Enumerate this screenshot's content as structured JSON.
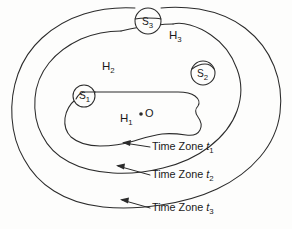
{
  "figure": {
    "name": "nested-time-zone-contours",
    "background_color": "#fdfdfc",
    "ink_color": "#2b2b2b",
    "width": 292,
    "height": 229
  },
  "regions": [
    {
      "id": "H1",
      "base": "H",
      "sub": "1",
      "x": 120,
      "y": 122,
      "description": "innermost region"
    },
    {
      "id": "H2",
      "base": "H",
      "sub": "2",
      "x": 102,
      "y": 70,
      "description": "middle region"
    },
    {
      "id": "H3",
      "base": "H",
      "sub": "3",
      "x": 169,
      "y": 39,
      "description": "outer region"
    }
  ],
  "spheres": [
    {
      "id": "S1",
      "base": "S",
      "sub": "1",
      "cx": 84,
      "cy": 96,
      "r": 11,
      "label_x": 79,
      "label_y": 99
    },
    {
      "id": "S2",
      "base": "S",
      "sub": "2",
      "cx": 203,
      "cy": 73,
      "r": 12,
      "label_x": 197,
      "label_y": 77
    },
    {
      "id": "S3",
      "base": "S",
      "sub": "3",
      "cx": 148,
      "cy": 21,
      "r": 13,
      "label_x": 142,
      "label_y": 25
    }
  ],
  "center_point": {
    "id": "O",
    "label": "O",
    "dot_x": 141,
    "dot_y": 114,
    "label_x": 145,
    "label_y": 117
  },
  "annotations": [
    {
      "id": "t1",
      "prefix": "Time Zone ",
      "symbol": "t",
      "sub": "1",
      "text_x": 152,
      "text_y": 150,
      "arrow_tip_x": 124,
      "arrow_tip_y": 143,
      "leader_from_x": 150,
      "leader_from_y": 147
    },
    {
      "id": "t2",
      "prefix": "Time Zone ",
      "symbol": "t",
      "sub": "2",
      "text_x": 152,
      "text_y": 178,
      "arrow_tip_x": 118,
      "arrow_tip_y": 166,
      "leader_from_x": 150,
      "leader_from_y": 175
    },
    {
      "id": "t3",
      "prefix": "Time Zone ",
      "symbol": "t",
      "sub": "3",
      "text_x": 152,
      "text_y": 211,
      "arrow_tip_x": 122,
      "arrow_tip_y": 200,
      "leader_from_x": 150,
      "leader_from_y": 208
    }
  ],
  "contours": {
    "outer_label": "t3 boundary",
    "middle_label": "t2 boundary",
    "inner_label": "t1 boundary"
  }
}
